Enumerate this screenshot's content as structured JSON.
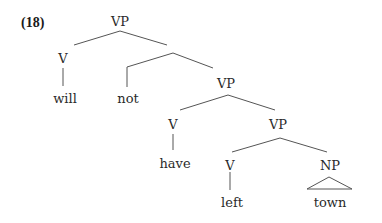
{
  "example_number": "(18)",
  "nodes": {
    "vp1": "VP",
    "v1": "V",
    "will": "will",
    "not": "not",
    "vp2": "VP",
    "v2": "V",
    "have": "have",
    "vp3": "VP",
    "v3": "V",
    "left": "left",
    "np": "NP",
    "town": "town"
  }
}
